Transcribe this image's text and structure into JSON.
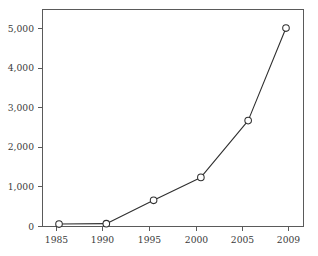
{
  "chart_data": {
    "type": "line",
    "title": "",
    "subtitle": "",
    "xlabel": "",
    "ylabel": "",
    "categories": [
      "1985",
      "1990",
      "1995",
      "2000",
      "2005",
      "2009"
    ],
    "x": [
      1985,
      1990,
      1995,
      2000,
      2005,
      2009
    ],
    "values": [
      50,
      60,
      660,
      1250,
      2710,
      5090
    ],
    "series": [
      {
        "name": "",
        "values": [
          50,
          60,
          660,
          1250,
          2710,
          5090
        ]
      }
    ],
    "xlim": [
      1983.2,
      2010.8
    ],
    "ylim": [
      0,
      5580
    ],
    "xticks": [
      1985,
      1990,
      1995,
      2000,
      2005,
      2009
    ],
    "xticklabels": [
      "1985",
      "1990",
      "1995",
      "2000",
      "2005",
      "2009"
    ],
    "yticks": [
      0,
      1000,
      2000,
      3000,
      4000,
      5000
    ],
    "yticklabels": [
      "0",
      "1,000",
      "2,000",
      "3,000",
      "4,000",
      "5,000"
    ],
    "grid": false,
    "legend": false,
    "legend_position": "none",
    "marker": "open-circle",
    "line_color": "#2f2f2f",
    "marker_fill": "#ffffff",
    "axis_color": "#5a5a5a",
    "background_color": "#ffffff",
    "annotations": []
  },
  "figure": {
    "plot_area": {
      "left": 42,
      "right": 303,
      "top": 9,
      "bottom": 226
    }
  }
}
